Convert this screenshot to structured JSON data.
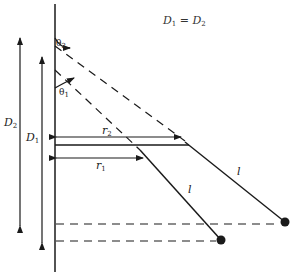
{
  "equation": {
    "lhs": "D",
    "lhs_sub": "1",
    "op": " = ",
    "rhs": "D",
    "rhs_sub": "2"
  },
  "labels": {
    "D2": {
      "main": "D",
      "sub": "2"
    },
    "D1": {
      "main": "D",
      "sub": "1"
    },
    "theta2": {
      "main": "θ",
      "sub": "2"
    },
    "theta1": {
      "main": "θ",
      "sub": "1"
    },
    "r2": {
      "main": "r",
      "sub": "2"
    },
    "r1": {
      "main": "r",
      "sub": "1"
    },
    "l_short": "l",
    "l_long": "l"
  },
  "colors": {
    "ink": "#1a1a1a",
    "background": "#ffffff"
  }
}
